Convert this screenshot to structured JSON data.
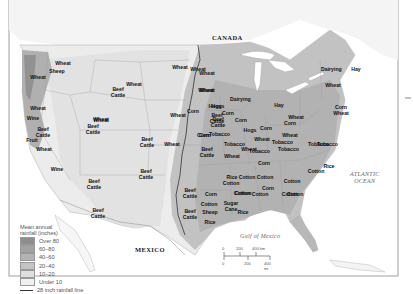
{
  "map": {
    "countries": {
      "canada": "CANADA",
      "mexico": "MEXICO"
    },
    "water_bodies": {
      "gulf": "Gulf of Mexico",
      "atlantic_line1": "ATLANTIC",
      "atlantic_line2": "OCEAN"
    },
    "colors": {
      "over_80": "#8e8e8e",
      "r60_80": "#a2a2a2",
      "r40_60": "#b3b3b3",
      "r20_40": "#c4c4c4",
      "r10_20": "#dedede",
      "under_10": "#ececec",
      "background": "#ffffff"
    },
    "labels": [
      {
        "text": "Wheat",
        "x": 63,
        "y": 64
      },
      {
        "text": "Sheep",
        "x": 57,
        "y": 72
      },
      {
        "text": "Wheat",
        "x": 38,
        "y": 78
      },
      {
        "text": "Wheat",
        "x": 38,
        "y": 109
      },
      {
        "text": "Wine",
        "x": 33,
        "y": 119
      },
      {
        "text": "Beef\nCattle",
        "x": 43,
        "y": 130
      },
      {
        "text": "Fruit",
        "x": 32,
        "y": 141
      },
      {
        "text": "Wheat",
        "x": 44,
        "y": 150
      },
      {
        "text": "Wine",
        "x": 57,
        "y": 170
      },
      {
        "text": "Wheat",
        "x": 101,
        "y": 120
      },
      {
        "text": "Beef\nCattle",
        "x": 93,
        "y": 127
      },
      {
        "text": "Wheat",
        "x": 134,
        "y": 85
      },
      {
        "text": "Beef\nCattle",
        "x": 118,
        "y": 90
      },
      {
        "text": "Wheat",
        "x": 101,
        "y": 121
      },
      {
        "text": "Beef\nCattle",
        "x": 94,
        "y": 182
      },
      {
        "text": "Beef\nCattle",
        "x": 98,
        "y": 211
      },
      {
        "text": "Beef\nCattle",
        "x": 146,
        "y": 172
      },
      {
        "text": "Beef\nCattle",
        "x": 147,
        "y": 140
      },
      {
        "text": "Wheat",
        "x": 178,
        "y": 116
      },
      {
        "text": "Wheat",
        "x": 172,
        "y": 145
      },
      {
        "text": "Wheat",
        "x": 180,
        "y": 68
      },
      {
        "text": "Wheat",
        "x": 198,
        "y": 70
      },
      {
        "text": "Wheat",
        "x": 207,
        "y": 91
      },
      {
        "text": "Corn",
        "x": 193,
        "y": 112
      },
      {
        "text": "Hogs",
        "x": 215,
        "y": 107
      },
      {
        "text": "Beef\nCattle",
        "x": 217,
        "y": 116
      },
      {
        "text": "Corn",
        "x": 203,
        "y": 136
      },
      {
        "text": "Beef\nCattle",
        "x": 207,
        "y": 150
      },
      {
        "text": "Wheat",
        "x": 207,
        "y": 74
      },
      {
        "text": "Wheat",
        "x": 206,
        "y": 91
      },
      {
        "text": "Dairying",
        "x": 240,
        "y": 100
      },
      {
        "text": "Hogs",
        "x": 218,
        "y": 107
      },
      {
        "text": "Corn",
        "x": 228,
        "y": 114
      },
      {
        "text": "Beef\nCattle",
        "x": 218,
        "y": 120
      },
      {
        "text": "Corn",
        "x": 241,
        "y": 121
      },
      {
        "text": "Hogs",
        "x": 250,
        "y": 131
      },
      {
        "text": "Corn",
        "x": 266,
        "y": 129
      },
      {
        "text": "Hay",
        "x": 279,
        "y": 106
      },
      {
        "text": "Wheat",
        "x": 296,
        "y": 118
      },
      {
        "text": "Corn",
        "x": 290,
        "y": 124
      },
      {
        "text": "Wheat",
        "x": 290,
        "y": 136
      },
      {
        "text": "Wheat",
        "x": 333,
        "y": 86
      },
      {
        "text": "Dairying",
        "x": 331,
        "y": 70
      },
      {
        "text": "Hay",
        "x": 356,
        "y": 70
      },
      {
        "text": "Corn\nWheat",
        "x": 341,
        "y": 108
      },
      {
        "text": "Tobacco",
        "x": 327,
        "y": 145
      },
      {
        "text": "Tobacco",
        "x": 234,
        "y": 145
      },
      {
        "text": "Wheat",
        "x": 249,
        "y": 150
      },
      {
        "text": "Corn",
        "x": 205,
        "y": 136
      },
      {
        "text": "Tobacco",
        "x": 219,
        "y": 135
      },
      {
        "text": "Wheat",
        "x": 232,
        "y": 157
      },
      {
        "text": "Tobacco",
        "x": 259,
        "y": 152
      },
      {
        "text": "Wheat",
        "x": 262,
        "y": 140
      },
      {
        "text": "Tobacco",
        "x": 282,
        "y": 143
      },
      {
        "text": "Tobacco",
        "x": 288,
        "y": 150
      },
      {
        "text": "Tobacco",
        "x": 318,
        "y": 145
      },
      {
        "text": "Corn",
        "x": 264,
        "y": 164
      },
      {
        "text": "Rice",
        "x": 329,
        "y": 167
      },
      {
        "text": "Cotton",
        "x": 316,
        "y": 172
      },
      {
        "text": "Cotton",
        "x": 247,
        "y": 178
      },
      {
        "text": "Cotton",
        "x": 265,
        "y": 178
      },
      {
        "text": "Cotton",
        "x": 292,
        "y": 182
      },
      {
        "text": "Corn",
        "x": 268,
        "y": 189
      },
      {
        "text": "Cotton",
        "x": 242,
        "y": 194
      },
      {
        "text": "Cotton",
        "x": 290,
        "y": 195
      },
      {
        "text": "Cotton",
        "x": 260,
        "y": 195
      },
      {
        "text": "Cotton",
        "x": 295,
        "y": 195
      },
      {
        "text": "Rice",
        "x": 232,
        "y": 178
      },
      {
        "text": "Beef\nCattle",
        "x": 190,
        "y": 191
      },
      {
        "text": "Corn",
        "x": 211,
        "y": 195
      },
      {
        "text": "Cotton",
        "x": 209,
        "y": 205
      },
      {
        "text": "Sugar\nCane",
        "x": 231,
        "y": 204
      },
      {
        "text": "Rice",
        "x": 243,
        "y": 213
      },
      {
        "text": "Beef\nCattle",
        "x": 190,
        "y": 212
      },
      {
        "text": "Sheep",
        "x": 210,
        "y": 213
      },
      {
        "text": "Rice",
        "x": 210,
        "y": 223
      },
      {
        "text": "Cotton",
        "x": 231,
        "y": 184
      },
      {
        "text": "Cotton",
        "x": 243,
        "y": 194
      }
    ],
    "legend": {
      "title_line1": "Mean annual",
      "title_line2": "rainfall (inches)",
      "items": [
        "Over 80",
        "60–80",
        "40–60",
        "20–40",
        "10–20",
        "Under 10"
      ],
      "line_label": "28 inch rainfall line"
    },
    "scale_bar": {
      "km_labels": [
        "0",
        "200",
        "400 km"
      ],
      "mi_labels": [
        "0",
        "200",
        "400 mi"
      ]
    }
  }
}
